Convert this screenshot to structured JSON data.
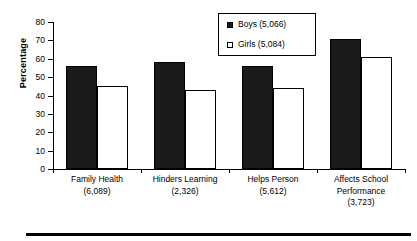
{
  "chart_data": {
    "type": "bar",
    "title": "",
    "xlabel": "",
    "ylabel": "Percentage",
    "ylim": [
      0,
      80
    ],
    "yticks": [
      0,
      10,
      20,
      30,
      40,
      50,
      60,
      70,
      80
    ],
    "grid": false,
    "legend_position": "top-center",
    "categories": [
      {
        "name": "Family Health",
        "count": "(6,089)"
      },
      {
        "name": "Hinders Learning",
        "count": "(2,326)"
      },
      {
        "name": "Helps Person",
        "count": "(5,612)"
      },
      {
        "name": "Affects School Performance",
        "count": "(3,723)"
      }
    ],
    "category_labels": [
      "Family Health",
      "Hinders Learning",
      "Helps Person",
      "Affects School Performance"
    ],
    "series": [
      {
        "name": "Boys (5,066)",
        "color": "#1a1a1a",
        "values": [
          56,
          58,
          56,
          71
        ]
      },
      {
        "name": "Girls (5,084)",
        "color": "#ffffff",
        "values": [
          45,
          43,
          44,
          61
        ]
      }
    ]
  },
  "legend": {
    "entries": [
      {
        "label": "Boys (5,066)",
        "swatch": "filled-square"
      },
      {
        "label": "Girls (5,084)",
        "swatch": "open-square"
      }
    ]
  },
  "axis": {
    "y_title": "Percentage",
    "y_tick_labels": [
      "80",
      "70",
      "60",
      "50",
      "40",
      "30",
      "20",
      "10",
      "0"
    ]
  },
  "cat_line1": [
    "Family Health",
    "Hinders Learning",
    "Helps Person",
    "Affects School"
  ],
  "cat_line2": [
    "(6,089)",
    "(2,326)",
    "(5,612)",
    "Performance"
  ],
  "cat_line3": [
    "",
    "",
    "",
    "(3,723)"
  ]
}
